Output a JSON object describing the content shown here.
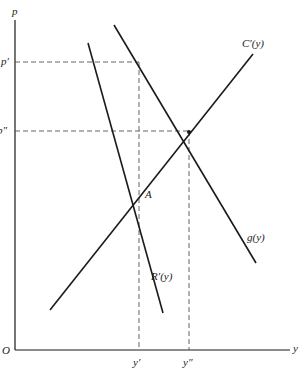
{
  "diagram": {
    "axes": {
      "y_axis_label": "p",
      "x_axis_label": "y",
      "origin_label": "O"
    },
    "price_levels": [
      {
        "label": "p′",
        "id": "p-prime"
      },
      {
        "label": "p″",
        "id": "p-double-prime"
      }
    ],
    "quantity_levels": [
      {
        "label": "y′",
        "id": "y-prime"
      },
      {
        "label": "y″",
        "id": "y-double-prime"
      }
    ],
    "curves": [
      {
        "id": "marginal-cost",
        "label": "C′(y)"
      },
      {
        "id": "demand-g",
        "label": "g(y)"
      },
      {
        "id": "marginal-revenue",
        "label": "R′(y)"
      }
    ],
    "points": [
      {
        "id": "point-a",
        "label": "A"
      }
    ],
    "colors": {
      "line": "#1a1a1a",
      "dashed": "#555555",
      "background": "#ffffff"
    }
  }
}
